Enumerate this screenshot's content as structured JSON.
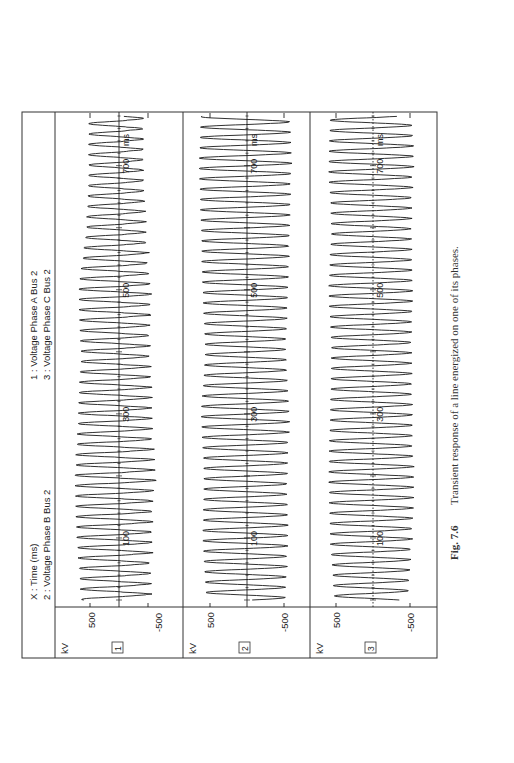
{
  "figure": {
    "caption_number": "Fig. 7.6",
    "caption_text": "Transient response of a line energized on one of its phases.",
    "legend": {
      "x_label": "X :  Time (ms)",
      "line1": "1 :  Voltage Phase A Bus 2",
      "line2": "2 :  Voltage Phase B Bus 2",
      "line3": "3 :  Voltage Phase C Bus 2"
    },
    "orientation": "rotated 90° counter-clockwise (landscape page)"
  },
  "chart_data": {
    "type": "line",
    "title": "Transient response of a line energized on one of its phases",
    "xlabel": "Time (ms)",
    "x_unit": "ms",
    "ylabel": "kV",
    "xlim": [
      0,
      780
    ],
    "x_ticks": [
      100,
      300,
      500,
      700
    ],
    "x_tick_labels": [
      "100",
      "300",
      "500",
      "700"
    ],
    "x_minor_ticks": [
      0,
      200,
      400,
      600
    ],
    "ylim": [
      -800,
      800
    ],
    "y_ticks": [
      500,
      -500
    ],
    "y_tick_labels": [
      "500",
      "-500"
    ],
    "grid": false,
    "zero_line": true,
    "legend_position": "header band above plots",
    "frequency_hz_approx": 60,
    "series": [
      {
        "id": 1,
        "name": "Voltage Phase A Bus 2",
        "panel_label": "1",
        "unit": "kV",
        "zero_line_style": "solid",
        "peak_kV_approx": 750,
        "min_kV_approx": -650,
        "description": "Large oscillation ±600–750 kV with distorted, noisy negative half-cycles (trapped-charge/reflection effects) throughout 0–780 ms",
        "envelope": [
          [
            0,
            650
          ],
          [
            100,
            720
          ],
          [
            200,
            760
          ],
          [
            300,
            700
          ],
          [
            400,
            650
          ],
          [
            500,
            700
          ],
          [
            600,
            560
          ],
          [
            700,
            520
          ],
          [
            780,
            520
          ]
        ],
        "distortion": 0.55
      },
      {
        "id": 2,
        "name": "Voltage Phase B Bus 2",
        "panel_label": "2",
        "unit": "kV",
        "zero_line_style": "solid",
        "peak_kV_approx": 650,
        "min_kV_approx": -650,
        "description": "Induced oscillation ±500–650 kV, fairly regular sinusoidal with minor distortion",
        "envelope": [
          [
            0,
            550
          ],
          [
            100,
            600
          ],
          [
            200,
            580
          ],
          [
            300,
            620
          ],
          [
            400,
            560
          ],
          [
            500,
            600
          ],
          [
            600,
            620
          ],
          [
            700,
            650
          ],
          [
            780,
            620
          ]
        ],
        "distortion": 0.2
      },
      {
        "id": 3,
        "name": "Voltage Phase C Bus 2",
        "panel_label": "3",
        "unit": "kV",
        "zero_line_style": "dotted",
        "peak_kV_approx": 650,
        "min_kV_approx": -650,
        "description": "Induced oscillation ±500–650 kV, sinusoidal with beat-like amplitude variation",
        "envelope": [
          [
            0,
            520
          ],
          [
            100,
            580
          ],
          [
            200,
            600
          ],
          [
            300,
            580
          ],
          [
            400,
            560
          ],
          [
            500,
            600
          ],
          [
            600,
            560
          ],
          [
            700,
            600
          ],
          [
            780,
            580
          ]
        ],
        "distortion": 0.25
      }
    ]
  },
  "panels": [
    {
      "label": "1",
      "unit": "kV",
      "tick_pos": "500",
      "tick_neg": "-500"
    },
    {
      "label": "2",
      "unit": "kV",
      "tick_pos": "500",
      "tick_neg": "-500"
    },
    {
      "label": "3",
      "unit": "kV",
      "tick_pos": "500",
      "tick_neg": "-500"
    }
  ],
  "time_labels": {
    "t100": "100",
    "t300": "300",
    "t500": "500",
    "t700": "700",
    "unit": "ms"
  },
  "colors": {
    "ink": "#1a1a1a",
    "frame": "#333333",
    "background": "#ffffff",
    "caption": "#333333"
  }
}
